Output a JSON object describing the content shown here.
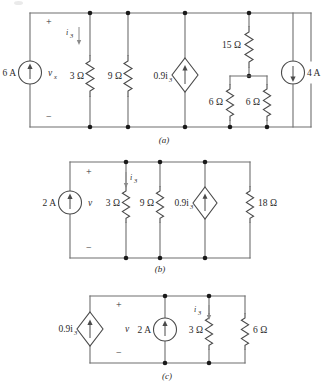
{
  "figure": {
    "captions": [
      "(a)",
      "(b)",
      "(c)"
    ]
  },
  "circuit_a": {
    "caption": "(a)",
    "elements": [
      {
        "name": "current-source-6a",
        "type": "independent-current-source",
        "label": "6 A",
        "arrow": "up"
      },
      {
        "name": "voltage-label-vx",
        "type": "voltage-label",
        "label": "v",
        "subscript": "x"
      },
      {
        "name": "polarity-plus",
        "type": "polarity",
        "label": "+"
      },
      {
        "name": "polarity-minus",
        "type": "polarity",
        "label": "−"
      },
      {
        "name": "current-label-i3",
        "type": "current-label",
        "label": "i",
        "subscript": "3",
        "arrow": "down"
      },
      {
        "name": "resistor-3ohm",
        "type": "resistor",
        "label": "3 Ω"
      },
      {
        "name": "resistor-9ohm",
        "type": "resistor",
        "label": "9 Ω"
      },
      {
        "name": "dependent-source-09i3",
        "type": "dependent-current-source",
        "label": "0.9i",
        "subscript": "3",
        "arrow": "up"
      },
      {
        "name": "resistor-15ohm",
        "type": "resistor",
        "label": "15 Ω"
      },
      {
        "name": "resistor-6ohm-left",
        "type": "resistor",
        "label": "6 Ω"
      },
      {
        "name": "resistor-6ohm-right",
        "type": "resistor",
        "label": "6 Ω"
      },
      {
        "name": "current-source-4a",
        "type": "independent-current-source",
        "label": "4 A",
        "arrow": "down"
      }
    ]
  },
  "circuit_b": {
    "caption": "(b)",
    "elements": [
      {
        "name": "current-source-2a",
        "type": "independent-current-source",
        "label": "2 A",
        "arrow": "up"
      },
      {
        "name": "voltage-label-v",
        "type": "voltage-label",
        "label": "v"
      },
      {
        "name": "polarity-plus",
        "type": "polarity",
        "label": "+"
      },
      {
        "name": "polarity-minus",
        "type": "polarity",
        "label": "−"
      },
      {
        "name": "current-label-i3",
        "type": "current-label",
        "label": "i",
        "subscript": "3",
        "arrow": "down"
      },
      {
        "name": "resistor-3ohm",
        "type": "resistor",
        "label": "3 Ω"
      },
      {
        "name": "resistor-9ohm",
        "type": "resistor",
        "label": "9 Ω"
      },
      {
        "name": "dependent-source-09i3",
        "type": "dependent-current-source",
        "label": "0.9i",
        "subscript": "3",
        "arrow": "up"
      },
      {
        "name": "resistor-18ohm",
        "type": "resistor",
        "label": "18 Ω"
      }
    ]
  },
  "circuit_c": {
    "caption": "(c)",
    "elements": [
      {
        "name": "dependent-source-09i3",
        "type": "dependent-current-source",
        "label": "0.9i",
        "subscript": "3",
        "arrow": "up"
      },
      {
        "name": "voltage-label-v",
        "type": "voltage-label",
        "label": "v"
      },
      {
        "name": "polarity-plus",
        "type": "polarity",
        "label": "+"
      },
      {
        "name": "polarity-minus",
        "type": "polarity",
        "label": "−"
      },
      {
        "name": "current-source-2a",
        "type": "independent-current-source",
        "label": "2 A",
        "arrow": "up"
      },
      {
        "name": "current-label-i3",
        "type": "current-label",
        "label": "i",
        "subscript": "3",
        "arrow": "down"
      },
      {
        "name": "resistor-3ohm",
        "type": "resistor",
        "label": "3 Ω"
      },
      {
        "name": "resistor-6ohm",
        "type": "resistor",
        "label": "6 Ω"
      }
    ]
  }
}
